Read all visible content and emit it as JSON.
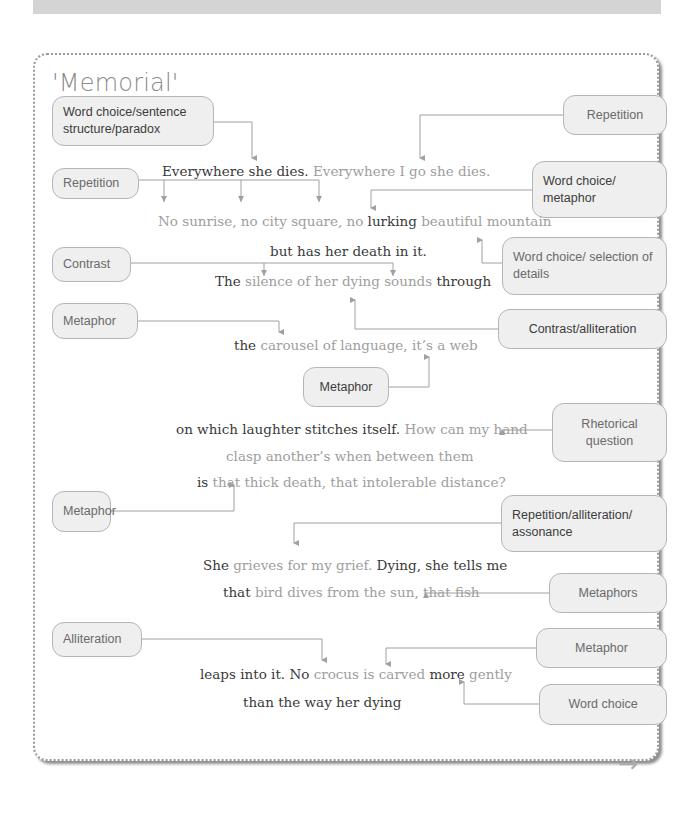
{
  "title": "'Memorial'",
  "annotations": {
    "word_choice_structure_paradox": "Word choice/sentence structure/paradox",
    "repetition_right": "Repetition",
    "repetition_left": "Repetition",
    "word_choice_metaphor": "Word choice/ metaphor",
    "contrast": "Contrast",
    "word_choice_selection": "Word choice/ selection of details",
    "metaphor_carousel": "Metaphor",
    "contrast_alliteration": "Contrast/alliteration",
    "metaphor_web": "Metaphor",
    "rhetorical_question": "Rhetorical question",
    "metaphor_death": "Metaphor",
    "repetition_alliteration_assonance": "Repetition/alliteration/ assonance",
    "metaphors": "Metaphors",
    "alliteration": "Alliteration",
    "metaphor_crocus": "Metaphor",
    "word_choice": "Word choice"
  },
  "poem": {
    "line1": {
      "a": "Everywhere she dies.",
      "b": " Everywhere I go she dies."
    },
    "line2": {
      "a": "No sunrise, no city square, no ",
      "b": "lurking",
      "c": " beautiful mountain"
    },
    "line3": {
      "a": "but has her death in it."
    },
    "line4": {
      "a": "The",
      "b": " silence of her dying sounds",
      "c": " through"
    },
    "line5": {
      "a": "the",
      "b": " carousel of language, it’s a web"
    },
    "line6": {
      "a": "on which laughter stitches itself.",
      "b": " How can my hand"
    },
    "line7": {
      "a": "clasp another’s when between them"
    },
    "line8": {
      "a": "is",
      "b": " that thick death, that intolerable distance?"
    },
    "line9": {
      "a": "She",
      "b": " grieves for my grief.",
      "c": " Dying, she tells me"
    },
    "line10": {
      "a": "that",
      "b": " bird dives from the sun, that fish"
    },
    "line11": {
      "a": "leaps into it. No",
      "b": " crocus is carved",
      "c": " more",
      "d": " gently"
    },
    "line12": {
      "a": "than the way her dying"
    }
  },
  "navigation": {
    "next_icon": "→"
  },
  "colors": {
    "note_bg": "#efefef",
    "note_border": "#b5b5b5",
    "dark_text": "#3a3a3a",
    "light_text": "#9e9e9e",
    "connector": "#a0a0a0"
  }
}
